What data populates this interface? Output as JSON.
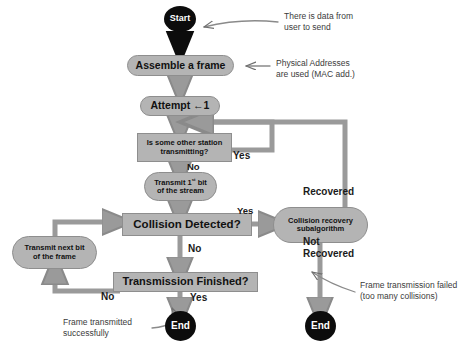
{
  "diagram": {
    "colors": {
      "shape_fill": "#b4b4b4",
      "shape_stroke": "#8e8e8e",
      "terminal_fill": "#0c0c0c",
      "connector": "#9a9a9a",
      "annotation_text": "#3b3b3b",
      "label_text": "#1b1b1b",
      "background": "#ffffff"
    }
  },
  "nodes": {
    "start": {
      "label": "Start",
      "shape": "terminal"
    },
    "assemble": {
      "label": "Assemble a frame",
      "shape": "pill"
    },
    "attempt": {
      "label": "Attempt ←1",
      "shape": "pill"
    },
    "station_busy": {
      "label_line1": "Is some other station",
      "label_line2": "transmitting?",
      "shape": "rect"
    },
    "transmit_first": {
      "label_line1_pre": "Transmit 1",
      "label_line1_sup": "st",
      "label_line1_post": " bit",
      "label_line2": "of the stream",
      "shape": "pill"
    },
    "collision": {
      "label": "Collision Detected?",
      "shape": "rect"
    },
    "recovery": {
      "label_line1": "Collision recovery",
      "label_line2": "subalgorithm",
      "shape": "pill"
    },
    "transmit_next": {
      "label_line1": "Transmit next bit",
      "label_line2": "of the frame",
      "shape": "pill"
    },
    "finished": {
      "label": "Transmission Finished?",
      "shape": "rect"
    },
    "end_success": {
      "label": "End",
      "shape": "terminal"
    },
    "end_fail": {
      "label": "End",
      "shape": "terminal"
    }
  },
  "edge_labels": {
    "station_yes": "Yes",
    "station_no": "No",
    "collision_yes": "Yes",
    "collision_no": "No",
    "recovered": "Recovered",
    "not_recovered_line1": "Not",
    "not_recovered_line2": "Recovered",
    "finished_no": "No",
    "finished_yes": "Yes"
  },
  "annotations": {
    "start_note_line1": "There is data from",
    "start_note_line2": "user to send",
    "assemble_note_line1": "Physical Addresses",
    "assemble_note_line2": "are used (MAC add.)",
    "success_note_line1": "Frame transmitted",
    "success_note_line2": "successfully",
    "fail_note_line1": "Frame transmission failed",
    "fail_note_line2": "(too many collisions)"
  }
}
